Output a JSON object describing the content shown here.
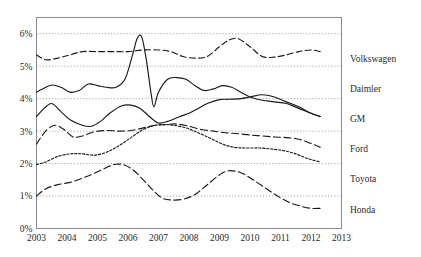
{
  "chart_data": {
    "type": "line",
    "title": "",
    "xlabel": "",
    "ylabel": "",
    "xlim": [
      2003,
      2013
    ],
    "ylim": [
      0,
      6.5
    ],
    "grid": true,
    "legend_position": "right",
    "y_ticks": [
      "0%",
      "1%",
      "2%",
      "3%",
      "4%",
      "5%",
      "6%"
    ],
    "y_tick_values": [
      0,
      1,
      2,
      3,
      4,
      5,
      6
    ],
    "x_ticks": [
      "2003",
      "2004",
      "2005",
      "2006",
      "2007",
      "2008",
      "2009",
      "2010",
      "2011",
      "2012",
      "2013"
    ],
    "x_tick_values": [
      2003,
      2004,
      2005,
      2006,
      2007,
      2008,
      2009,
      2010,
      2011,
      2012,
      2013
    ],
    "value_unit": "%",
    "series": [
      {
        "name": "Volkswagen",
        "style": "dashed",
        "x": [
          2003.0,
          2003.3,
          2003.7,
          2004.1,
          2004.5,
          2005.0,
          2005.5,
          2006.0,
          2006.5,
          2007.0,
          2007.4,
          2007.8,
          2008.2,
          2008.6,
          2009.0,
          2009.3,
          2009.6,
          2010.0,
          2010.4,
          2010.8,
          2011.2,
          2011.6,
          2012.0,
          2012.3
        ],
        "values": [
          5.35,
          5.2,
          5.25,
          5.35,
          5.45,
          5.45,
          5.45,
          5.45,
          5.5,
          5.5,
          5.45,
          5.3,
          5.25,
          5.3,
          5.6,
          5.8,
          5.85,
          5.6,
          5.3,
          5.28,
          5.35,
          5.45,
          5.5,
          5.45
        ]
      },
      {
        "name": "Daimler",
        "style": "solid",
        "x": [
          2003.0,
          2003.2,
          2003.5,
          2003.8,
          2004.1,
          2004.4,
          2004.7,
          2005.0,
          2005.3,
          2005.6,
          2005.9,
          2006.15,
          2006.3,
          2006.45,
          2006.6,
          2006.75,
          2006.85,
          2007.0,
          2007.3,
          2007.6,
          2007.9,
          2008.2,
          2008.5,
          2008.8,
          2009.1,
          2009.4,
          2009.7,
          2010.0,
          2010.4,
          2010.8,
          2011.2,
          2011.6,
          2012.0,
          2012.3
        ],
        "values": [
          4.2,
          4.3,
          4.42,
          4.35,
          4.2,
          4.25,
          4.45,
          4.4,
          4.35,
          4.35,
          4.6,
          5.35,
          5.85,
          5.9,
          5.2,
          4.2,
          3.75,
          4.2,
          4.6,
          4.65,
          4.6,
          4.4,
          4.25,
          4.3,
          4.4,
          4.35,
          4.2,
          4.05,
          3.95,
          3.9,
          3.85,
          3.7,
          3.55,
          3.45
        ]
      },
      {
        "name": "GM",
        "style": "solid",
        "x": [
          2003.0,
          2003.25,
          2003.5,
          2003.8,
          2004.1,
          2004.5,
          2004.8,
          2005.1,
          2005.4,
          2005.8,
          2006.1,
          2006.4,
          2006.7,
          2007.0,
          2007.3,
          2007.7,
          2008.0,
          2008.3,
          2008.6,
          2009.0,
          2009.3,
          2009.7,
          2010.0,
          2010.4,
          2010.8,
          2011.2,
          2011.6,
          2012.0,
          2012.3
        ],
        "values": [
          3.45,
          3.7,
          3.85,
          3.6,
          3.35,
          3.18,
          3.15,
          3.3,
          3.55,
          3.78,
          3.8,
          3.7,
          3.45,
          3.25,
          3.3,
          3.45,
          3.55,
          3.7,
          3.85,
          3.97,
          3.98,
          4.0,
          4.05,
          4.12,
          4.05,
          3.9,
          3.75,
          3.55,
          3.45
        ]
      },
      {
        "name": "Ford",
        "style": "long-dash",
        "x": [
          2003.0,
          2003.3,
          2003.6,
          2003.9,
          2004.2,
          2004.5,
          2004.9,
          2005.3,
          2005.7,
          2006.1,
          2006.5,
          2006.9,
          2007.2,
          2007.6,
          2008.0,
          2008.4,
          2008.8,
          2009.2,
          2009.6,
          2010.0,
          2010.4,
          2010.8,
          2011.2,
          2011.6,
          2012.0,
          2012.3
        ],
        "values": [
          2.6,
          3.0,
          3.18,
          3.05,
          2.82,
          2.85,
          2.98,
          3.02,
          3.0,
          3.02,
          3.1,
          3.18,
          3.2,
          3.22,
          3.15,
          3.05,
          3.0,
          2.95,
          2.92,
          2.88,
          2.85,
          2.82,
          2.8,
          2.75,
          2.62,
          2.5
        ]
      },
      {
        "name": "Toyota",
        "style": "dotted",
        "x": [
          2003.0,
          2003.3,
          2003.7,
          2004.1,
          2004.5,
          2004.9,
          2005.3,
          2005.7,
          2006.1,
          2006.5,
          2006.9,
          2007.2,
          2007.5,
          2007.9,
          2008.3,
          2008.7,
          2009.1,
          2009.5,
          2009.9,
          2010.3,
          2010.7,
          2011.1,
          2011.5,
          2011.9,
          2012.3
        ],
        "values": [
          1.97,
          2.05,
          2.22,
          2.3,
          2.3,
          2.26,
          2.35,
          2.55,
          2.8,
          3.05,
          3.18,
          3.2,
          3.18,
          3.1,
          2.95,
          2.78,
          2.6,
          2.5,
          2.48,
          2.48,
          2.45,
          2.4,
          2.3,
          2.15,
          2.05
        ]
      },
      {
        "name": "Honda",
        "style": "long-dash",
        "x": [
          2003.0,
          2003.3,
          2003.7,
          2004.1,
          2004.5,
          2004.9,
          2005.3,
          2005.6,
          2005.9,
          2006.2,
          2006.5,
          2006.8,
          2007.1,
          2007.4,
          2007.8,
          2008.2,
          2008.6,
          2009.0,
          2009.3,
          2009.7,
          2010.1,
          2010.5,
          2010.9,
          2011.3,
          2011.7,
          2012.0,
          2012.3
        ],
        "values": [
          1.0,
          1.22,
          1.35,
          1.42,
          1.55,
          1.7,
          1.88,
          1.98,
          1.95,
          1.78,
          1.5,
          1.2,
          0.95,
          0.88,
          0.9,
          1.05,
          1.35,
          1.65,
          1.78,
          1.72,
          1.5,
          1.25,
          1.0,
          0.8,
          0.68,
          0.62,
          0.62
        ]
      }
    ]
  },
  "legend": {
    "items": [
      {
        "label": "Volkswagen"
      },
      {
        "label": "Daimler"
      },
      {
        "label": "GM"
      },
      {
        "label": "Ford"
      },
      {
        "label": "Toyota"
      },
      {
        "label": "Honda"
      }
    ]
  }
}
